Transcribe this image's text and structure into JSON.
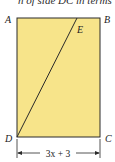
{
  "cropped_text": "n of side DC in terms",
  "figure": {
    "fill_color": "#f7e48a",
    "stroke_color": "#2a2a2a",
    "vertices": {
      "A": "A",
      "B": "B",
      "C": "C",
      "D": "D",
      "E": "E"
    },
    "segments": [
      "AB",
      "BC",
      "CD",
      "DA",
      "DE"
    ],
    "dimension_label": "3x + 3",
    "dimension_of": "DC"
  }
}
